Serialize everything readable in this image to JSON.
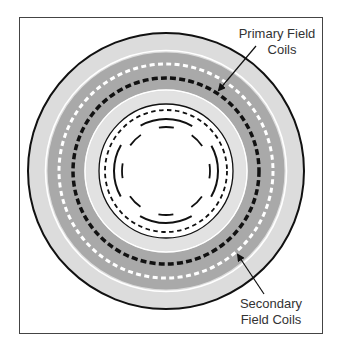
{
  "diagram": {
    "labels": {
      "primary_line1": "Primary Field",
      "primary_line2": "Coils",
      "secondary_line1": "Secondary",
      "secondary_line2": "Field Coils"
    },
    "colors": {
      "outer_band": "#dcdcdc",
      "coil_band": "#a9a9a9",
      "inner_band": "#e2e2e2",
      "outline": "#111111",
      "text": "#333333",
      "frame": "#444444"
    },
    "rings": [
      {
        "name": "outer-boundary",
        "style": "solid",
        "color": "black"
      },
      {
        "name": "secondary-field-coils",
        "style": "dashed",
        "color": "white"
      },
      {
        "name": "primary-field-coils",
        "style": "dashed",
        "color": "black"
      },
      {
        "name": "inner-boundary",
        "style": "solid",
        "color": "black"
      },
      {
        "name": "inner-short-dash-ring",
        "style": "dashed",
        "color": "black"
      },
      {
        "name": "inner-long-dash-ring",
        "style": "long-dashed",
        "color": "black"
      },
      {
        "name": "innermost-dash-ring",
        "style": "long-dashed",
        "color": "black"
      }
    ]
  }
}
